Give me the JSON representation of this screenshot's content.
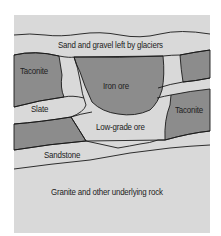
{
  "diagram": {
    "type": "geologic-cross-section",
    "colors": {
      "light": "#d9d9d9",
      "dark": "#8c8c8c",
      "line": "#1a1a1a",
      "background": "#ffffff"
    },
    "labels": {
      "glacier": "Sand and gravel left by glaciers",
      "taconite_left": "Taconite",
      "iron_ore": "Iron ore",
      "slate": "Slate",
      "taconite_right": "Taconite",
      "low_grade_ore": "Low-grade ore",
      "sandstone": "Sandstone",
      "granite": "Granite and other underlying rock"
    }
  }
}
